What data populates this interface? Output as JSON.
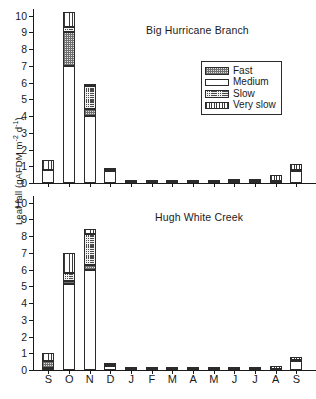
{
  "figure": {
    "ylabel_text": "Leaf fall (gAFDM m",
    "ylabel_sup1": "-2",
    "ylabel_mid": " d",
    "ylabel_sup2": "-1",
    "ylabel_close": ")"
  },
  "legend": {
    "items": [
      {
        "label": "Fast",
        "pattern": "pat-fast",
        "icon": "swatch-fast-icon"
      },
      {
        "label": "Medium",
        "pattern": "pat-medium",
        "icon": "swatch-medium-icon"
      },
      {
        "label": "Slow",
        "pattern": "pat-slow",
        "icon": "swatch-slow-icon"
      },
      {
        "label": "Very slow",
        "pattern": "pat-veryslow",
        "icon": "swatch-very-slow-icon"
      }
    ]
  },
  "chart_data": [
    {
      "type": "bar",
      "subtype": "stacked",
      "title": "Big Hurricane Branch",
      "xlabel": "",
      "ylabel": "Leaf fall (gAFDM m-2 d-1)",
      "ylim": [
        0,
        10.4
      ],
      "yticks": [
        0,
        1,
        2,
        3,
        4,
        5,
        6,
        7,
        8,
        9,
        10
      ],
      "ytick_labels": [
        "0",
        "1",
        "2",
        "3",
        "4",
        "5",
        "6",
        "7",
        "8",
        "9",
        "10"
      ],
      "grid": false,
      "legend_position": "inside-upper-right",
      "categories": [
        "S",
        "O",
        "N",
        "D",
        "J",
        "F",
        "M",
        "A",
        "M",
        "J",
        "J",
        "A",
        "S"
      ],
      "series": [
        {
          "name": "Fast",
          "values": [
            0.0,
            2.0,
            0.4,
            0.1,
            0.0,
            0.0,
            0.0,
            0.0,
            0.0,
            0.02,
            0.0,
            0.0,
            0.0
          ]
        },
        {
          "name": "Medium",
          "values": [
            0.8,
            7.0,
            4.0,
            0.7,
            0.05,
            0.04,
            0.04,
            0.04,
            0.03,
            0.04,
            0.05,
            0.05,
            0.7
          ]
        },
        {
          "name": "Slow",
          "values": [
            0.0,
            0.3,
            1.4,
            0.0,
            0.02,
            0.02,
            0.02,
            0.02,
            0.02,
            0.04,
            0.06,
            0.05,
            0.05
          ]
        },
        {
          "name": "Very slow",
          "values": [
            0.55,
            0.9,
            0.05,
            0.1,
            0.02,
            0.02,
            0.02,
            0.02,
            0.02,
            0.04,
            0.1,
            0.35,
            0.4
          ]
        }
      ],
      "totals": [
        1.35,
        10.2,
        5.85,
        0.9,
        0.09,
        0.08,
        0.08,
        0.08,
        0.07,
        0.14,
        0.21,
        0.45,
        1.15
      ]
    },
    {
      "type": "bar",
      "subtype": "stacked",
      "title": "Hugh White Creek",
      "xlabel": "",
      "ylabel": "Leaf fall (gAFDM m-2 d-1)",
      "ylim": [
        0,
        10.4
      ],
      "yticks": [
        0,
        1,
        2,
        3,
        4,
        5,
        6,
        7,
        8,
        9,
        10
      ],
      "ytick_labels": [
        "0",
        "1",
        "2",
        "3",
        "4",
        "5",
        "6",
        "7",
        "8",
        "9",
        "10"
      ],
      "grid": false,
      "legend_position": "none",
      "categories": [
        "S",
        "O",
        "N",
        "D",
        "J",
        "F",
        "M",
        "A",
        "M",
        "J",
        "J",
        "A",
        "S"
      ],
      "series": [
        {
          "name": "Fast",
          "values": [
            0.45,
            0.2,
            0.25,
            0.02,
            0.0,
            0.0,
            0.0,
            0.0,
            0.0,
            0.0,
            0.0,
            0.0,
            0.0
          ]
        },
        {
          "name": "Medium",
          "values": [
            0.1,
            5.15,
            6.0,
            0.25,
            0.06,
            0.05,
            0.05,
            0.05,
            0.04,
            0.04,
            0.02,
            0.04,
            0.55
          ]
        },
        {
          "name": "Slow",
          "values": [
            0.0,
            0.45,
            1.9,
            0.0,
            0.02,
            0.02,
            0.02,
            0.02,
            0.02,
            0.02,
            0.02,
            0.02,
            0.02
          ]
        },
        {
          "name": "Very slow",
          "values": [
            0.45,
            1.2,
            0.25,
            0.03,
            0.02,
            0.02,
            0.02,
            0.02,
            0.02,
            0.14,
            0.02,
            0.18,
            0.2
          ]
        }
      ],
      "totals": [
        1.0,
        7.0,
        8.4,
        0.3,
        0.1,
        0.09,
        0.09,
        0.09,
        0.08,
        0.2,
        0.06,
        0.24,
        0.77
      ]
    }
  ]
}
